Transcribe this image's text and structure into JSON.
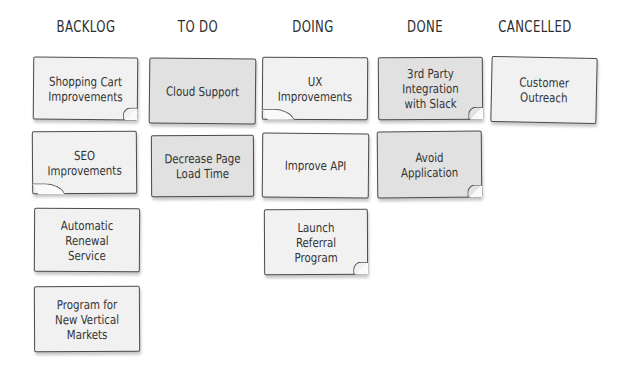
{
  "board": {
    "columns": [
      {
        "title": "BACKLOG",
        "cards": [
          "Shopping Cart Improvements",
          "SEO Improvements",
          "Automatic Renewal Service",
          "Program for New Vertical Markets"
        ]
      },
      {
        "title": "TO DO",
        "cards": [
          "Cloud Support",
          "Decrease Page Load Time"
        ]
      },
      {
        "title": "DOING",
        "cards": [
          "UX Improvements",
          "Improve API",
          "Launch Referral Program"
        ]
      },
      {
        "title": "DONE",
        "cards": [
          "3rd Party Integration with Slack",
          "Avoid Application"
        ]
      },
      {
        "title": "CANCELLED",
        "cards": [
          "Customer Outreach"
        ]
      }
    ]
  },
  "colors": {
    "note_light": "#f1f1f1",
    "note_dark": "#e1e1e1",
    "border": "#4a4a4a"
  }
}
